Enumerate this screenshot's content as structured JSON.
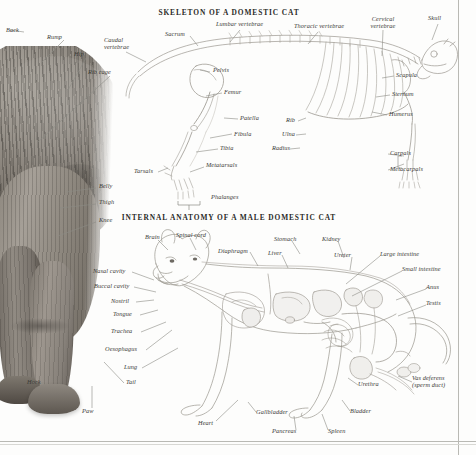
{
  "page": {
    "background_color": "#fdfdfc",
    "rule_color": "#b9b9b4",
    "label_color": "#3a3a36",
    "title_color": "#2b2b28",
    "leader_color": "#8b8b85"
  },
  "sections": [
    {
      "id": "skeleton",
      "title": "SKELETON OF A DOMESTIC CAT"
    },
    {
      "id": "internal",
      "title": "INTERNAL ANATOMY OF A MALE DOMESTIC CAT"
    }
  ],
  "photograph": {
    "subject": "domestic cat hindquarters",
    "style": "black and white photograph",
    "labels": [
      {
        "name": "back",
        "text": "Back",
        "x": 6,
        "y": 30
      },
      {
        "name": "rump",
        "text": "Rump",
        "x": 47,
        "y": 37
      },
      {
        "name": "hip",
        "text": "Hip",
        "x": 74,
        "y": 54
      },
      {
        "name": "rib-cage",
        "text": "Rib cage",
        "x": 88,
        "y": 72
      },
      {
        "name": "belly",
        "text": "Belly",
        "x": 99,
        "y": 186
      },
      {
        "name": "thigh",
        "text": "Thigh",
        "x": 99,
        "y": 202
      },
      {
        "name": "knee",
        "text": "Knee",
        "x": 99,
        "y": 220
      },
      {
        "name": "hock",
        "text": "Hock",
        "x": 27,
        "y": 382
      },
      {
        "name": "paw",
        "text": "Paw",
        "x": 82,
        "y": 411
      },
      {
        "name": "tail",
        "text": "Tail",
        "x": 126,
        "y": 382
      }
    ]
  },
  "skeleton": {
    "labels": [
      {
        "name": "caudal-vertebrae",
        "text": "Caudal vertebrae",
        "x": 106,
        "y": 42,
        "multiline": true
      },
      {
        "name": "sacrum",
        "text": "Sacrum",
        "x": 165,
        "y": 33
      },
      {
        "name": "lumbar-vertebrae",
        "text": "Lumbar vertebrae",
        "x": 216,
        "y": 23
      },
      {
        "name": "thoracic-vertebrae",
        "text": "Thoracic vertebrae",
        "x": 294,
        "y": 25
      },
      {
        "name": "cervical-vertebrae",
        "text": "Cervical vertebrae",
        "x": 368,
        "y": 18,
        "multiline": true
      },
      {
        "name": "skull",
        "text": "Skull",
        "x": 430,
        "y": 17
      },
      {
        "name": "pelvis",
        "text": "Pelvis",
        "x": 213,
        "y": 70
      },
      {
        "name": "femur",
        "text": "Femur",
        "x": 224,
        "y": 91
      },
      {
        "name": "patella",
        "text": "Patella",
        "x": 240,
        "y": 117
      },
      {
        "name": "fibula",
        "text": "Fibula",
        "x": 234,
        "y": 133
      },
      {
        "name": "tibia",
        "text": "Tibia",
        "x": 220,
        "y": 147
      },
      {
        "name": "tarsals",
        "text": "Tarsals",
        "x": 136,
        "y": 171
      },
      {
        "name": "metatarsals",
        "text": "Metatarsals",
        "x": 206,
        "y": 165
      },
      {
        "name": "phalanges",
        "text": "Phalanges",
        "x": 213,
        "y": 197
      },
      {
        "name": "rib",
        "text": "Rib",
        "x": 289,
        "y": 119
      },
      {
        "name": "ulna",
        "text": "Ulna",
        "x": 284,
        "y": 133
      },
      {
        "name": "radius",
        "text": "Radius",
        "x": 274,
        "y": 147
      },
      {
        "name": "scapula",
        "text": "Scapula",
        "x": 396,
        "y": 74
      },
      {
        "name": "sternum",
        "text": "Sternum",
        "x": 392,
        "y": 93
      },
      {
        "name": "humerus",
        "text": "Humerus",
        "x": 389,
        "y": 113
      },
      {
        "name": "carpals",
        "text": "Carpals",
        "x": 390,
        "y": 152
      },
      {
        "name": "metacarpals",
        "text": "Metacarpals",
        "x": 390,
        "y": 168
      }
    ]
  },
  "internal": {
    "labels": [
      {
        "name": "brain",
        "text": "Brain",
        "x": 147,
        "y": 237
      },
      {
        "name": "spinal-cord",
        "text": "Spinal cord",
        "x": 176,
        "y": 235
      },
      {
        "name": "diaphragm",
        "text": "Diaphragm",
        "x": 224,
        "y": 250
      },
      {
        "name": "liver",
        "text": "Liver",
        "x": 270,
        "y": 252
      },
      {
        "name": "stomach",
        "text": "Stomach",
        "x": 276,
        "y": 238
      },
      {
        "name": "kidney",
        "text": "Kidney",
        "x": 324,
        "y": 238
      },
      {
        "name": "ureter",
        "text": "Ureter",
        "x": 337,
        "y": 254
      },
      {
        "name": "large-intestine",
        "text": "Large intestine",
        "x": 382,
        "y": 253
      },
      {
        "name": "small-intestine",
        "text": "Small intestine",
        "x": 404,
        "y": 268
      },
      {
        "name": "anus",
        "text": "Anus",
        "x": 428,
        "y": 286
      },
      {
        "name": "testis",
        "text": "Testis",
        "x": 428,
        "y": 302
      },
      {
        "name": "nasal-cavity",
        "text": "Nasal cavity",
        "x": 95,
        "y": 270
      },
      {
        "name": "buccal-cavity",
        "text": "Buccal cavity",
        "x": 96,
        "y": 285
      },
      {
        "name": "nostril",
        "text": "Nostril",
        "x": 113,
        "y": 300
      },
      {
        "name": "tongue",
        "text": "Tongue",
        "x": 115,
        "y": 313
      },
      {
        "name": "trachea",
        "text": "Trachea",
        "x": 113,
        "y": 330
      },
      {
        "name": "oesophagus",
        "text": "Oesophagus",
        "x": 107,
        "y": 348
      },
      {
        "name": "lung",
        "text": "Lung",
        "x": 126,
        "y": 366
      },
      {
        "name": "heart",
        "text": "Heart",
        "x": 200,
        "y": 423
      },
      {
        "name": "gallbladder",
        "text": "Gallbladder",
        "x": 258,
        "y": 411
      },
      {
        "name": "pancreas",
        "text": "Pancreas",
        "x": 274,
        "y": 430
      },
      {
        "name": "spleen",
        "text": "Spleen",
        "x": 330,
        "y": 430
      },
      {
        "name": "bladder",
        "text": "Bladder",
        "x": 352,
        "y": 410
      },
      {
        "name": "urethra",
        "text": "Urethra",
        "x": 360,
        "y": 383
      },
      {
        "name": "vas-deferens",
        "text": "Vas deferens (sperm duct)",
        "x": 414,
        "y": 378,
        "multiline": true
      }
    ]
  }
}
